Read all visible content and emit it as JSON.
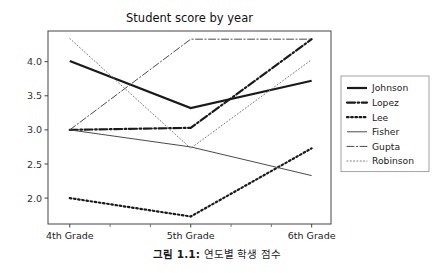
{
  "figure": {
    "caption_prefix": "그림 1.1:",
    "caption_text": "연도별 학생 점수"
  },
  "chart_data": {
    "type": "line",
    "title": "Student score by year",
    "xlabel": "",
    "ylabel": "",
    "categories": [
      "4th Grade",
      "5th Grade",
      "6th Grade"
    ],
    "x": [
      0,
      1,
      2
    ],
    "xlim": [
      -0.18,
      2.16
    ],
    "ylim": [
      1.62,
      4.45
    ],
    "yticks": [
      2.0,
      2.5,
      3.0,
      3.5,
      4.0
    ],
    "ytick_labels": [
      "2.0",
      "2.5",
      "3.0",
      "3.5",
      "4.0"
    ],
    "xtick_labels": [
      "4th Grade",
      "5th Grade",
      "6th Grade"
    ],
    "grid": false,
    "legend_position": "right",
    "frame": true,
    "series": [
      {
        "name": "Johnson",
        "values": [
          4.01,
          3.32,
          3.72
        ],
        "style": "solid",
        "width": 2.2,
        "color": "#1a1a1a"
      },
      {
        "name": "Lopez",
        "values": [
          3.0,
          3.03,
          4.33
        ],
        "style": "dashdot",
        "width": 2.2,
        "color": "#1a1a1a"
      },
      {
        "name": "Lee",
        "values": [
          2.0,
          1.73,
          2.73
        ],
        "style": "dotted",
        "width": 2.2,
        "color": "#1a1a1a"
      },
      {
        "name": "Fisher",
        "values": [
          3.0,
          2.75,
          2.33
        ],
        "style": "solid",
        "width": 1.0,
        "color": "#4a4a4a"
      },
      {
        "name": "Gupta",
        "values": [
          3.0,
          4.33,
          4.33
        ],
        "style": "dashdot",
        "width": 1.0,
        "color": "#4a4a4a"
      },
      {
        "name": "Robinson",
        "values": [
          4.34,
          2.73,
          4.03
        ],
        "style": "dotted",
        "width": 1.0,
        "color": "#7a7a7a"
      }
    ]
  },
  "legend": {
    "entries": [
      "Johnson",
      "Lopez",
      "Lee",
      "Fisher",
      "Gupta",
      "Robinson"
    ]
  }
}
